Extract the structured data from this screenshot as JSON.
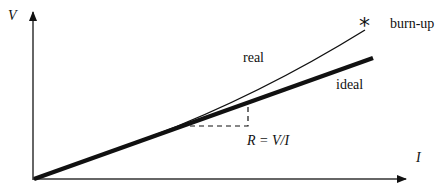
{
  "axes": {
    "y_label": "V",
    "x_label": "I"
  },
  "curves": {
    "real_label": "real",
    "ideal_label": "ideal",
    "burnup_label": "burn-up",
    "burnup_marker": "*"
  },
  "annotation": {
    "resistance": "R = V/I"
  },
  "colors": {
    "line": "#111111",
    "background": "#ffffff"
  }
}
